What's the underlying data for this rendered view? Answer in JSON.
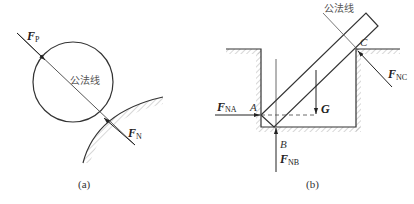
{
  "figure_a": {
    "force_p": {
      "main": "F",
      "sub": "P"
    },
    "force_n": {
      "main": "F",
      "sub": "N"
    },
    "normal_line_label": "公法线",
    "caption": "(a)"
  },
  "figure_b": {
    "normal_line_label": "公法线",
    "force_na": {
      "main": "F",
      "sub": "NA"
    },
    "force_nb": {
      "main": "F",
      "sub": "NB"
    },
    "force_nc": {
      "main": "F",
      "sub": "NC"
    },
    "gravity": "G",
    "point_a": "A",
    "point_b": "B",
    "point_c": "C",
    "caption": "(b)"
  },
  "colors": {
    "line": "#333333",
    "hatch": "#aaaaaa"
  }
}
